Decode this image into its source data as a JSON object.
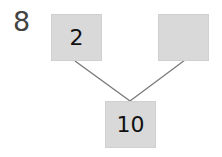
{
  "question_number": "8",
  "diagram": {
    "type": "number-bond",
    "parts": [
      {
        "position": "top-left",
        "value": "2"
      },
      {
        "position": "top-right",
        "value": ""
      }
    ],
    "whole": {
      "position": "bottom",
      "value": "10"
    },
    "colors": {
      "box_fill": "#d9d9d9",
      "line": "#777777",
      "text": "#111111"
    }
  }
}
